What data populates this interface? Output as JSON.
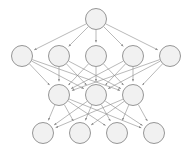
{
  "diagram": {
    "type": "layered-directed-graph",
    "background_color": "#ffffff",
    "node_fill_color": "#f1f1f1",
    "node_stroke_color": "#8a8a8a",
    "edge_color": "#8a8a8a",
    "node_radius": 10.5,
    "edge_arrowheads": true,
    "canvas": {
      "width": 193,
      "height": 150
    },
    "layers": [
      {
        "name": "layer-1",
        "count": 1,
        "y": 19,
        "nodes": [
          {
            "id": "L1N1",
            "cx": 96,
            "cy": 19,
            "label": ""
          }
        ]
      },
      {
        "name": "layer-2",
        "count": 5,
        "y": 56,
        "nodes": [
          {
            "id": "L2N1",
            "cx": 22,
            "cy": 56,
            "label": ""
          },
          {
            "id": "L2N2",
            "cx": 59,
            "cy": 56,
            "label": ""
          },
          {
            "id": "L2N3",
            "cx": 96,
            "cy": 56,
            "label": ""
          },
          {
            "id": "L2N4",
            "cx": 133,
            "cy": 56,
            "label": ""
          },
          {
            "id": "L2N5",
            "cx": 170,
            "cy": 56,
            "label": ""
          }
        ]
      },
      {
        "name": "layer-3",
        "count": 3,
        "y": 95,
        "nodes": [
          {
            "id": "L3N1",
            "cx": 59,
            "cy": 95,
            "label": ""
          },
          {
            "id": "L3N2",
            "cx": 96,
            "cy": 95,
            "label": ""
          },
          {
            "id": "L3N3",
            "cx": 133,
            "cy": 95,
            "label": ""
          }
        ]
      },
      {
        "name": "layer-4",
        "count": 4,
        "y": 133,
        "nodes": [
          {
            "id": "L4N1",
            "cx": 43,
            "cy": 133,
            "label": ""
          },
          {
            "id": "L4N2",
            "cx": 80,
            "cy": 133,
            "label": ""
          },
          {
            "id": "L4N3",
            "cx": 117,
            "cy": 133,
            "label": ""
          },
          {
            "id": "L4N4",
            "cx": 154,
            "cy": 133,
            "label": ""
          }
        ]
      }
    ],
    "edge_groups": [
      {
        "from_layer": "layer-1",
        "to_layer": "layer-2",
        "fully_connected": true
      },
      {
        "from_layer": "layer-2",
        "to_layer": "layer-3",
        "fully_connected": true
      },
      {
        "from_layer": "layer-3",
        "to_layer": "layer-4",
        "fully_connected": true
      }
    ]
  }
}
